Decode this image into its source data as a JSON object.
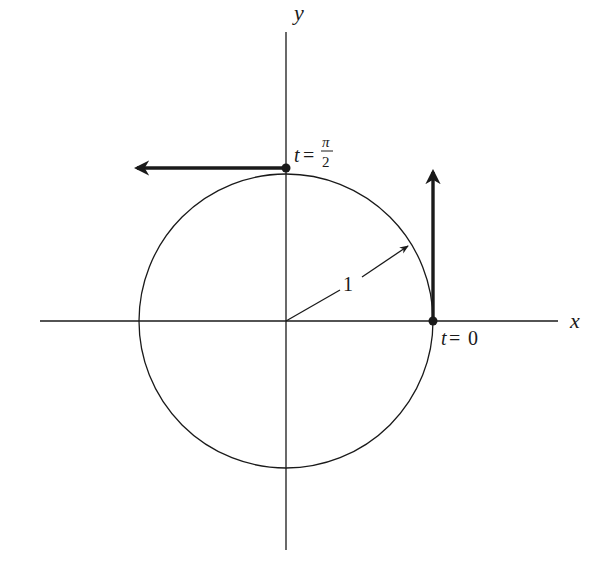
{
  "diagram": {
    "type": "unit-circle-velocity",
    "axes": {
      "x_label": "x",
      "y_label": "y"
    },
    "circle": {
      "radius_label": "1",
      "center": "origin"
    },
    "points": [
      {
        "name": "t0",
        "label_var": "t",
        "label_eq": "=",
        "label_val": "0",
        "position": "(1, 0)",
        "velocity_direction": "up"
      },
      {
        "name": "t_pi_over_2",
        "label_var": "t",
        "label_eq": "=",
        "label_num": "π",
        "label_den": "2",
        "position": "(0, 1)",
        "velocity_direction": "left"
      }
    ],
    "colors": {
      "ink": "#1a1a1a",
      "background": "#ffffff"
    }
  }
}
